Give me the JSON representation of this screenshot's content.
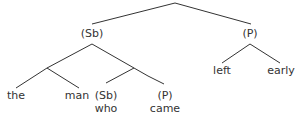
{
  "diagram": {
    "type": "syntax-tree",
    "root": {
      "label": "",
      "children": [
        {
          "label": "(Sb)",
          "children": [
            {
              "label": "",
              "children": [
                {
                  "label": "the"
                },
                {
                  "label": "man"
                }
              ]
            },
            {
              "label": "",
              "children": [
                {
                  "label": "(Sb)",
                  "word": "who"
                },
                {
                  "label": "(P)",
                  "word": "came"
                }
              ]
            }
          ]
        },
        {
          "label": "(P)",
          "children": [
            {
              "label": "left"
            },
            {
              "label": "early"
            }
          ]
        }
      ]
    },
    "labels": {
      "sb_top": "(Sb)",
      "p_top": "(P)",
      "the": "the",
      "man": "man",
      "sb_inner": "(Sb)",
      "who": "who",
      "p_inner": "(P)",
      "came": "came",
      "left": "left",
      "early": "early"
    },
    "line_color": "#333333"
  }
}
